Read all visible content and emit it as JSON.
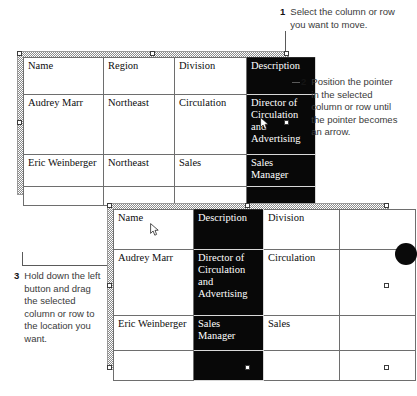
{
  "steps": [
    {
      "number": "1",
      "text": "Select the column or row you want to move."
    },
    {
      "number": "2",
      "text": "Position the pointer in the selected column or row until the pointer becomes an arrow."
    },
    {
      "number": "3",
      "text": "Hold down the left button and drag the selected column or row to the location you want."
    }
  ],
  "tables": [
    {
      "name": "table-before-move",
      "columns": [
        "Name",
        "Region",
        "Division",
        "Description"
      ],
      "selected_column_index": 3,
      "rows": [
        [
          "Name",
          "Region",
          "Division",
          "Description"
        ],
        [
          "Audrey Marr",
          "Northeast",
          "Circulation",
          "Director of Circulation and Advertising"
        ],
        [
          "Eric Weinberger",
          "Northeast",
          "Sales",
          "Sales Manager"
        ],
        [
          "",
          "",
          "",
          ""
        ]
      ]
    },
    {
      "name": "table-after-move",
      "columns": [
        "Name",
        "Description",
        "Division",
        ""
      ],
      "selected_column_index": 1,
      "rows": [
        [
          "Name",
          "Description",
          "Division",
          ""
        ],
        [
          "Audrey Marr",
          "Director of Circulation and Advertising",
          "Circulation",
          ""
        ],
        [
          "Eric Weinberger",
          "Sales Manager",
          "Sales",
          ""
        ],
        [
          "",
          "",
          "",
          ""
        ]
      ]
    }
  ],
  "icons": {
    "pointer": "mouse-arrow-pointer"
  },
  "colors": {
    "selection_fill": "#080808",
    "selection_text": "#ffffff",
    "grid_line": "#6e6e6e",
    "body_text": "#3a3a3a",
    "frame_hatch": "#8d8d8d"
  }
}
